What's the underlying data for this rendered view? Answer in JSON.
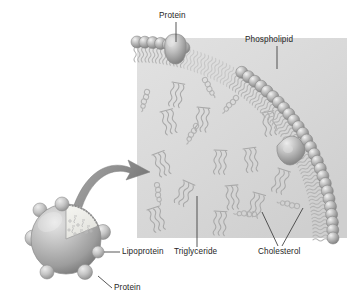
{
  "figure": {
    "background_color": "#ffffff",
    "text_color": "#262626",
    "core_fill": "#dcdcdc",
    "membrane_bead_color": "#9a9a9a",
    "tail_color": "#b4b4b4",
    "arrow_color": "#8c8c8c",
    "sphere_color": "#b0b0b0"
  },
  "labels": {
    "protein_top": "Protein",
    "phospholipid": "Phospholipid",
    "lipoprotein": "Lipoprotein",
    "triglyceride": "Triglyceride",
    "cholesterol": "Cholesterol",
    "protein_bottom": "Protein"
  },
  "components": [
    {
      "name": "protein",
      "label": "Protein",
      "count": 2,
      "location": "embedded in surface monolayer"
    },
    {
      "name": "phospholipid",
      "label": "Phospholipid",
      "location": "outer monolayer, polar head outward"
    },
    {
      "name": "triglyceride",
      "label": "Triglyceride",
      "location": "hydrophobic core"
    },
    {
      "name": "cholesterol",
      "label": "Cholesterol",
      "location": "core and monolayer"
    },
    {
      "name": "lipoprotein",
      "label": "Lipoprotein",
      "location": "whole particle"
    }
  ],
  "icons": {
    "arrow": "curved-magnify-arrow",
    "sphere": "lipoprotein-sphere",
    "cutaway": "cutaway-wedge"
  }
}
